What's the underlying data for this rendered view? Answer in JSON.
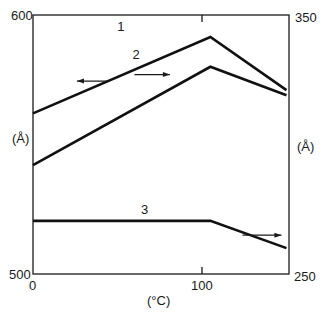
{
  "chart_data": {
    "type": "line",
    "title": "",
    "xlabel": "(°C)",
    "ylabel_left": "(Å)",
    "ylabel_right": "(Å)",
    "xlim": [
      0,
      150
    ],
    "ylim_left": [
      500,
      600
    ],
    "ylim_right": [
      250,
      350
    ],
    "x_ticks": [
      {
        "value": 0,
        "label": "0"
      },
      {
        "value": 100,
        "label": "100"
      }
    ],
    "y_left_ticks": [
      {
        "value": 500,
        "label": "500"
      },
      {
        "value": 600,
        "label": "600"
      }
    ],
    "y_right_ticks": [
      {
        "value": 250,
        "label": "250"
      },
      {
        "value": 350,
        "label": "350"
      }
    ],
    "grid": false,
    "legend": "inline labels with arrows indicating axis",
    "series": [
      {
        "name": "1",
        "axis": "left",
        "arrow_direction": "left",
        "points": [
          [
            0,
            562
          ],
          [
            105,
            591.5
          ],
          [
            150,
            571
          ]
        ]
      },
      {
        "name": "2",
        "axis": "right",
        "arrow_direction": "right",
        "points": [
          [
            0,
            292
          ],
          [
            105,
            330
          ],
          [
            150,
            319
          ]
        ]
      },
      {
        "name": "3",
        "axis": "right",
        "arrow_direction": "right",
        "points": [
          [
            0,
            270.5
          ],
          [
            105,
            270.5
          ],
          [
            150,
            260
          ]
        ]
      }
    ],
    "annotations": [
      {
        "text": "1",
        "series": "1",
        "label_at": [
          52,
          594
        ],
        "arrow_from": [
          45,
          574.5
        ],
        "arrow_to": [
          26,
          574.5
        ]
      },
      {
        "text": "2",
        "series": "2",
        "label_at": [
          61,
          333
        ],
        "arrow_from": [
          60,
          327
        ],
        "arrow_to": [
          81,
          327
        ]
      },
      {
        "text": "3",
        "series": "3",
        "label_at": [
          66,
          273
        ],
        "arrow_from": [
          124,
          265
        ],
        "arrow_to": [
          147,
          265
        ]
      }
    ]
  }
}
